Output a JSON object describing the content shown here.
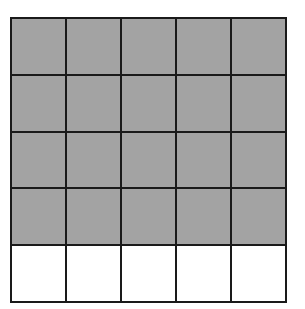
{
  "diagram": {
    "type": "fraction-grid",
    "rows": 5,
    "columns": 5,
    "total_cells": 25,
    "shaded_cells": 20,
    "shaded_rows": [
      0,
      1,
      2,
      3
    ],
    "unshaded_rows": [
      4
    ],
    "colors": {
      "shaded": "#a3a3a3",
      "unshaded": "#ffffff",
      "line": "#1a1a1a"
    }
  }
}
